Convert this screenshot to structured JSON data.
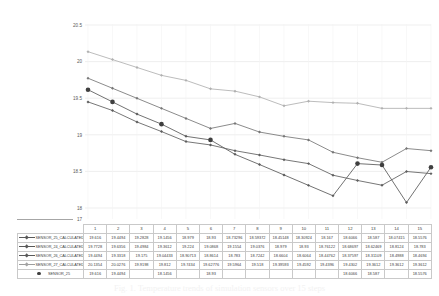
{
  "chart_data": {
    "type": "line",
    "title": "",
    "xlabel": "",
    "ylabel": "",
    "ylim": [
      17,
      20.5
    ],
    "yticks": [
      "20.5",
      "20",
      "19.5",
      "19",
      "18.5",
      "18",
      "17"
    ],
    "ytick_values": [
      20.5,
      20,
      19.5,
      19,
      18.5,
      18,
      17
    ],
    "grid": true,
    "legend_position": "table-left",
    "categories": [
      "1",
      "2",
      "3",
      "4",
      "5",
      "6",
      "7",
      "8",
      "9",
      "10",
      "11",
      "12",
      "13",
      "14",
      "15"
    ],
    "series": [
      {
        "name": "SENSOR_25_CALCULATED",
        "color": "#595959",
        "marker": "diamond",
        "values": [
          19.616,
          19.4494,
          19.2828,
          19.1456,
          18.979,
          18.93,
          18.73296,
          18.59372,
          18.45148,
          18.30924,
          18.167,
          18.6066,
          18.587,
          18.07415,
          18.5576
        ]
      },
      {
        "name": "SENSOR_24_CALCULATED",
        "color": "#767676",
        "marker": "diamond",
        "values": [
          19.7728,
          19.6356,
          19.4984,
          19.3612,
          19.224,
          19.0868,
          19.1554,
          19.0376,
          18.979,
          18.93,
          18.76122,
          18.68697,
          18.62469,
          18.8124,
          18.783
        ]
      },
      {
        "name": "SENSOR_26_CALCULATED",
        "color": "#5e5e5e",
        "marker": "diamond",
        "values": [
          19.4494,
          19.3318,
          19.175,
          19.04433,
          18.90713,
          18.8614,
          18.783,
          18.7242,
          18.6604,
          18.6064,
          18.44762,
          18.37597,
          18.31109,
          18.4988,
          18.4694
        ]
      },
      {
        "name": "SENSOR_27_CALCULATED",
        "color": "#b0b0b0",
        "marker": "diamond",
        "values": [
          20.1354,
          20.0276,
          19.9198,
          19.812,
          19.7434,
          19.62776,
          19.5964,
          19.518,
          19.39593,
          19.4592,
          19.4396,
          19.4302,
          19.3612,
          19.3612,
          19.3612
        ]
      },
      {
        "name": "SENSOR_25",
        "color": "#3f3f3f",
        "marker": "dot",
        "values": [
          19.616,
          19.4494,
          null,
          19.1456,
          null,
          18.93,
          null,
          null,
          null,
          null,
          null,
          18.6066,
          18.587,
          null,
          18.5576
        ]
      }
    ]
  },
  "table": {
    "corner_label": "",
    "columns": [
      "1",
      "2",
      "3",
      "4",
      "5",
      "6",
      "7",
      "8",
      "9",
      "10",
      "11",
      "12",
      "13",
      "14",
      "15"
    ],
    "rows": [
      {
        "label": "SENSOR_25_CALCULATED",
        "symbol": "line-marker",
        "values": [
          "19.616",
          "19.4494",
          "19.2828",
          "19.1456",
          "18.979",
          "18.93",
          "18.73296",
          "18.59372",
          "18.45148",
          "18.30924",
          "18.167",
          "18.6066",
          "18.587",
          "18.07415",
          "18.5576"
        ]
      },
      {
        "label": "SENSOR_24_CALCULATED",
        "symbol": "line-marker",
        "values": [
          "19.7728",
          "19.6356",
          "19.4984",
          "19.3612",
          "19.224",
          "19.0868",
          "19.1554",
          "19.0376",
          "18.979",
          "18.93",
          "18.76122",
          "18.68697",
          "18.62469",
          "18.8124",
          "18.783"
        ]
      },
      {
        "label": "SENSOR_26_CALCULATED",
        "symbol": "line-marker",
        "values": [
          "19.4494",
          "19.3318",
          "19.175",
          "19.04433",
          "18.90713",
          "18.8614",
          "18.783",
          "18.7242",
          "18.6604",
          "18.6064",
          "18.44762",
          "18.37597",
          "18.31109",
          "18.4988",
          "18.4694"
        ]
      },
      {
        "label": "SENSOR_27_CALCULATED",
        "symbol": "line-marker-light",
        "values": [
          "20.1354",
          "20.0276",
          "19.9198",
          "19.812",
          "19.7434",
          "19.62776",
          "19.5964",
          "19.518",
          "19.39593",
          "19.4592",
          "19.4396",
          "19.4302",
          "19.3612",
          "19.3612",
          "19.3612"
        ]
      },
      {
        "label": "SENSOR_25",
        "symbol": "dot",
        "values": [
          "19.616",
          "19.4494",
          "",
          "18.1456",
          "",
          "18.93",
          "",
          "",
          "",
          "",
          "",
          "18.6066",
          "18.587",
          "",
          "18.5576"
        ]
      }
    ]
  },
  "caption": {
    "text": "Fig. 1. Temperature trends of simulation sensors over 15 steps"
  }
}
